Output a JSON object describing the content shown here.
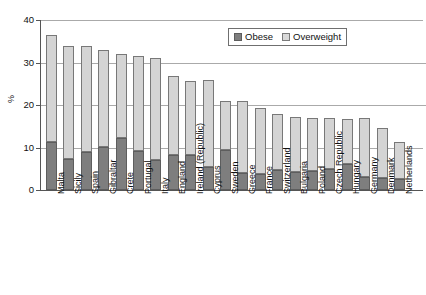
{
  "chart_data": {
    "type": "bar",
    "stacked": true,
    "title": "",
    "xlabel": "",
    "ylabel": "%",
    "ylim": [
      0,
      40
    ],
    "yticks": [
      0,
      10,
      20,
      30,
      40
    ],
    "grid": true,
    "legend_position": "top-right",
    "categories": [
      "Malta",
      "Sicily",
      "Spain",
      "Gibraltar",
      "Crete",
      "Portugal",
      "Italy",
      "England",
      "Ireland (Republic)",
      "Cyprus",
      "Sweden",
      "Greece",
      "France",
      "Switzerland",
      "Bulgaria",
      "Poland",
      "Czech Republic",
      "Hungary",
      "Germany",
      "Denmark",
      "Netherlands"
    ],
    "series": [
      {
        "name": "Obese",
        "color": "#7e7e7e",
        "values": [
          11.3,
          7.4,
          9.0,
          10.2,
          12.3,
          9.2,
          7.0,
          8.3,
          8.2,
          5.3,
          9.3,
          4.0,
          3.8,
          4.6,
          4.2,
          4.4,
          5.0,
          6.2,
          3.0,
          2.8,
          2.5
        ]
      },
      {
        "name": "Overweight",
        "color": "#d4d4d4",
        "values": [
          25.2,
          26.6,
          25.0,
          22.8,
          19.7,
          22.3,
          24.0,
          18.5,
          17.5,
          20.7,
          11.7,
          17.0,
          15.5,
          13.4,
          13.0,
          12.6,
          11.9,
          10.5,
          14.0,
          11.9,
          8.7
        ]
      }
    ],
    "totals": [
      36.5,
      34.0,
      34.0,
      33.0,
      32.0,
      31.5,
      31.0,
      26.8,
      25.7,
      26.0,
      21.0,
      21.0,
      19.3,
      18.0,
      17.2,
      17.0,
      16.9,
      16.7,
      17.0,
      14.7,
      11.2
    ]
  },
  "axis": {
    "y_title": "%",
    "y_tick_labels": [
      "40",
      "30",
      "20",
      "10",
      "0"
    ]
  },
  "legend": {
    "items": [
      {
        "label": "Obese",
        "swatch": "obese-swatch"
      },
      {
        "label": "Overweight",
        "swatch": "overweight-swatch"
      }
    ]
  }
}
